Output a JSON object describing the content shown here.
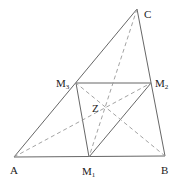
{
  "diagram": {
    "title": "",
    "points": {
      "A": {
        "label": "A",
        "x": 14,
        "y": 157
      },
      "B": {
        "label": "B",
        "x": 165,
        "y": 156
      },
      "C": {
        "label": "C",
        "x": 137,
        "y": 9
      },
      "M1": {
        "label": "M",
        "sub": "1",
        "x": 89,
        "y": 157
      },
      "M2": {
        "label": "M",
        "sub": "2",
        "x": 151,
        "y": 83
      },
      "M3": {
        "label": "M",
        "sub": "3",
        "x": 76,
        "y": 83
      },
      "Z": {
        "label": "Z",
        "x": 105,
        "y": 108
      }
    },
    "solid_segments": [
      [
        "A",
        "B"
      ],
      [
        "B",
        "C"
      ],
      [
        "C",
        "A"
      ],
      [
        "M1",
        "M2"
      ],
      [
        "M2",
        "M3"
      ],
      [
        "M3",
        "M1"
      ]
    ],
    "dashed_segments": [
      [
        "A",
        "M2"
      ],
      [
        "B",
        "M3"
      ],
      [
        "C",
        "M1"
      ]
    ]
  }
}
